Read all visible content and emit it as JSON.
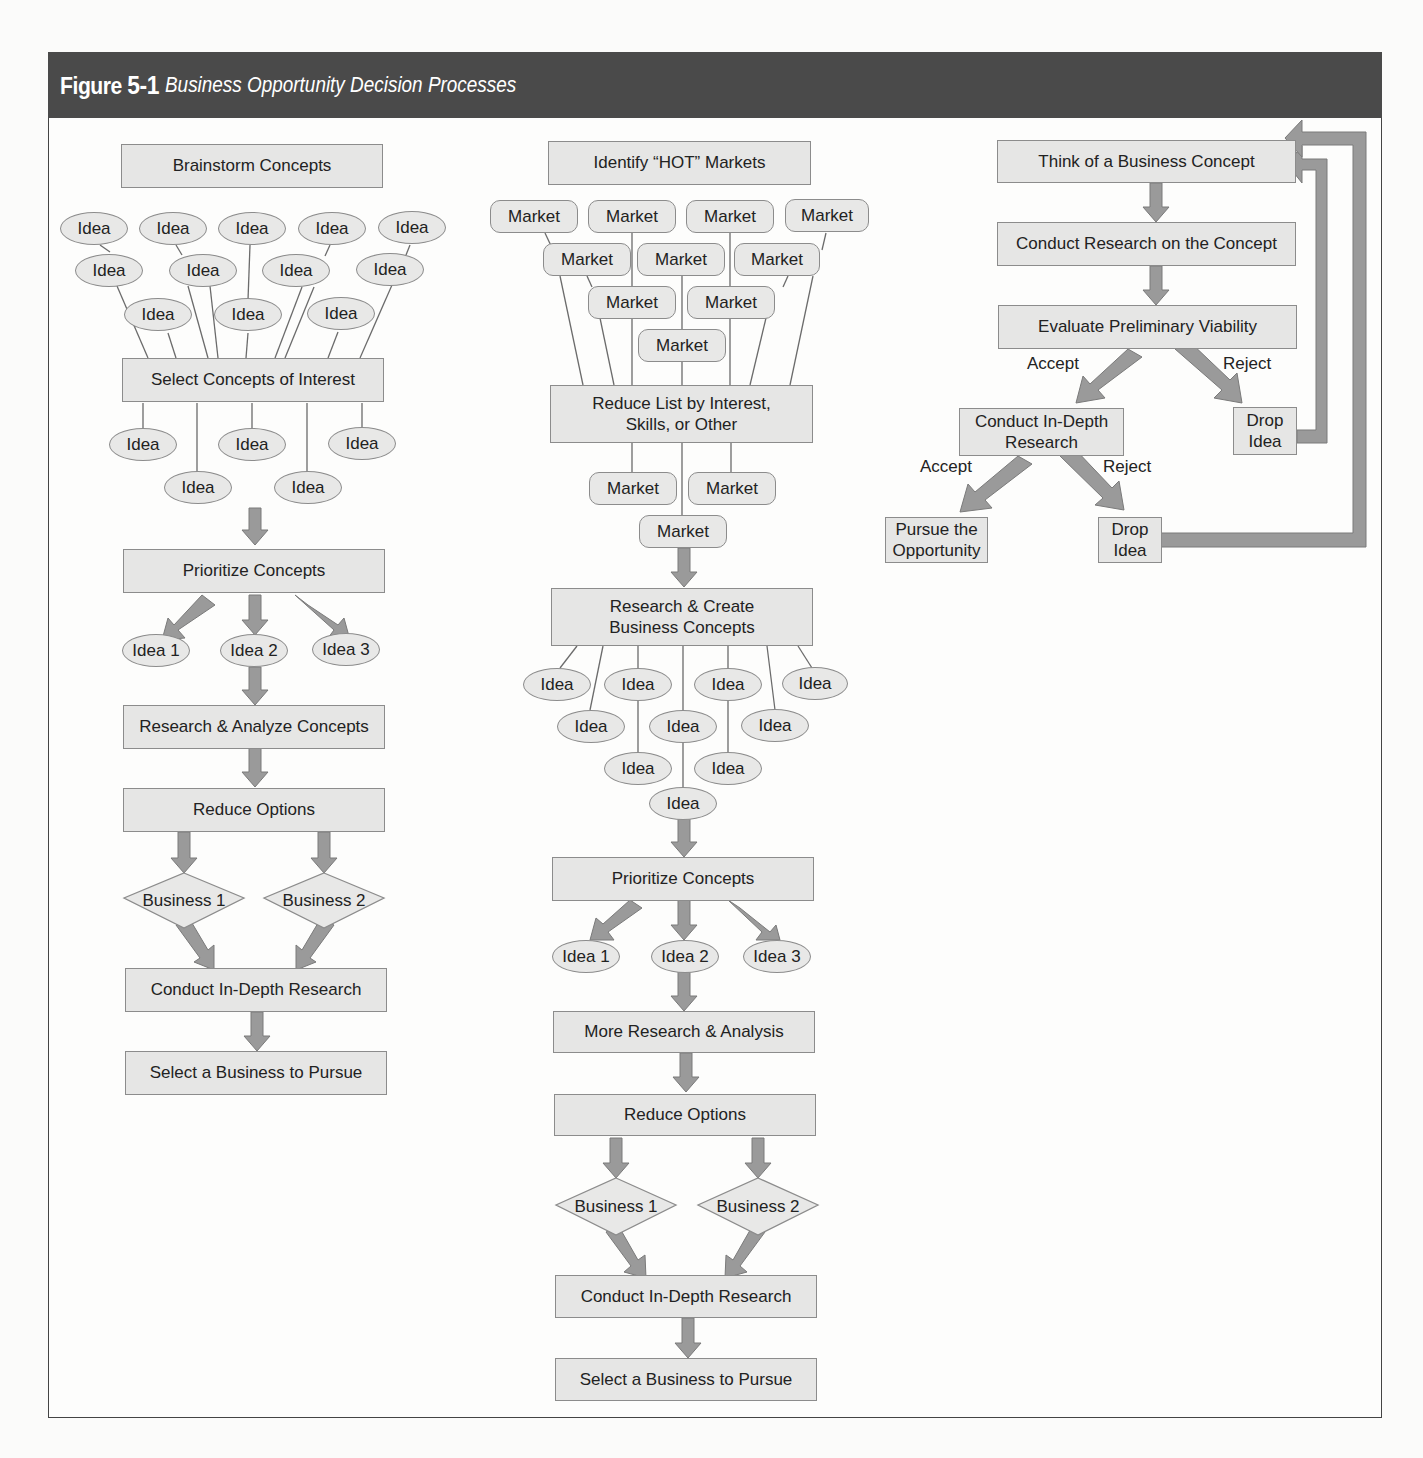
{
  "figure": {
    "label": "Figure",
    "number": "5-1",
    "title": "Business Opportunity Decision Processes"
  },
  "colors": {
    "header_bg": "#4a4a4a",
    "box_fill": "#e6e6e5",
    "box_border": "#8c8c8c",
    "arrow_fill": "#9a9a9a",
    "line": "#6b6b6b"
  },
  "left_flow": {
    "start": "Brainstorm Concepts",
    "ideas_top": [
      "Idea",
      "Idea",
      "Idea",
      "Idea",
      "Idea",
      "Idea",
      "Idea",
      "Idea",
      "Idea",
      "Idea",
      "Idea",
      "Idea"
    ],
    "select": "Select Concepts of Interest",
    "ideas_selected": [
      "Idea",
      "Idea",
      "Idea",
      "Idea",
      "Idea"
    ],
    "prioritize": "Prioritize Concepts",
    "ranked": [
      "Idea 1",
      "Idea 2",
      "Idea 3"
    ],
    "research": "Research & Analyze Concepts",
    "reduce": "Reduce Options",
    "businesses": [
      "Business 1",
      "Business 2"
    ],
    "in_depth": "Conduct In-Depth Research",
    "final": "Select a Business to Pursue"
  },
  "middle_flow": {
    "start": "Identify “HOT” Markets",
    "markets_top": [
      "Market",
      "Market",
      "Market",
      "Market",
      "Market",
      "Market",
      "Market",
      "Market",
      "Market",
      "Market"
    ],
    "reduce_list": "Reduce List by Interest, Skills, or Other",
    "markets_selected": [
      "Market",
      "Market",
      "Market"
    ],
    "research_create": "Research & Create Business Concepts",
    "ideas": [
      "Idea",
      "Idea",
      "Idea",
      "Idea",
      "Idea",
      "Idea",
      "Idea",
      "Idea",
      "Idea",
      "Idea"
    ],
    "prioritize": "Prioritize Concepts",
    "ranked": [
      "Idea 1",
      "Idea 2",
      "Idea 3"
    ],
    "more_research": "More Research & Analysis",
    "reduce": "Reduce Options",
    "businesses": [
      "Business 1",
      "Business 2"
    ],
    "in_depth": "Conduct In-Depth Research",
    "final": "Select a Business to Pursue"
  },
  "right_flow": {
    "think": "Think of a Business Concept",
    "research": "Conduct Research on the Concept",
    "evaluate": "Evaluate Preliminary Viability",
    "accept_1": "Accept",
    "reject_1": "Reject",
    "in_depth": "Conduct In-Depth Research",
    "drop_1": "Drop Idea",
    "accept_2": "Accept",
    "reject_2": "Reject",
    "pursue": "Pursue the Opportunity",
    "drop_2": "Drop Idea"
  }
}
